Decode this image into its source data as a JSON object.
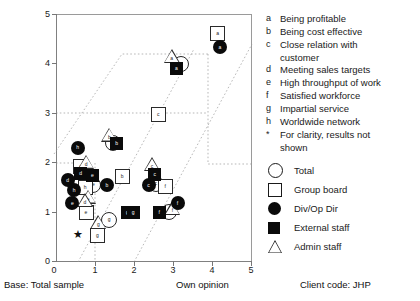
{
  "axes": {
    "y_ticks": [
      "0",
      "1",
      "2",
      "3",
      "4",
      "5"
    ],
    "x_ticks": [
      "0",
      "1",
      "2",
      "3",
      "4",
      "5"
    ],
    "xlabel_right": "Own opinion",
    "base_caption": "Base: Total sample",
    "client_code": "Client code:  JHP"
  },
  "key": {
    "items": [
      {
        "letter": "a",
        "text": "Being profitable"
      },
      {
        "letter": "b",
        "text": "Being cost effective"
      },
      {
        "letter": "c",
        "text": "Close relation with",
        "cont": "customer"
      },
      {
        "letter": "d",
        "text": "Meeting sales targets"
      },
      {
        "letter": "e",
        "text": "High throughput of work"
      },
      {
        "letter": "f",
        "text": "Satisfied workforce"
      },
      {
        "letter": "g",
        "text": "Impartial service"
      },
      {
        "letter": "h",
        "text": "Worldwide network"
      },
      {
        "letter": "*",
        "text": "For clarity, results not",
        "cont": "shown"
      }
    ]
  },
  "legend": {
    "items": [
      {
        "glyph": "circle-outline-icon",
        "label": "Total"
      },
      {
        "glyph": "square-outline-icon",
        "label": "Group board"
      },
      {
        "glyph": "circle-filled-icon",
        "label": "Div/Op Dir"
      },
      {
        "glyph": "square-filled-icon",
        "label": "External staff"
      },
      {
        "glyph": "triangle-outline-icon",
        "label": "Admin staff"
      }
    ]
  },
  "chart_data": {
    "type": "scatter",
    "title": "",
    "xlabel": "Own opinion",
    "ylabel": "",
    "xlim": [
      0,
      5
    ],
    "ylim": [
      0,
      5
    ],
    "grid": false,
    "legend_position": "right",
    "annotations": [
      "Base: Total sample",
      "Own opinion",
      "Client code:  JHP",
      "For clarity, results not shown"
    ],
    "series": [
      {
        "name": "Total",
        "marker": "circle-outline",
        "points": [
          {
            "label": "a",
            "x": 3.16,
            "y": 4.02
          },
          {
            "label": "b",
            "x": 1.44,
            "y": 2.41
          },
          {
            "label": "d",
            "x": 0.66,
            "y": 1.92
          },
          {
            "label": "e",
            "x": 0.93,
            "y": 1.58
          },
          {
            "label": "c",
            "x": 2.52,
            "y": 1.6
          },
          {
            "label": "g",
            "x": 1.33,
            "y": 0.87
          },
          {
            "label": "f",
            "x": 2.86,
            "y": 1.03
          }
        ]
      },
      {
        "name": "Group board",
        "marker": "square-outline",
        "points": [
          {
            "label": "a",
            "x": 4.1,
            "y": 4.62
          },
          {
            "label": "c",
            "x": 2.58,
            "y": 3.0
          },
          {
            "label": "b",
            "x": 1.66,
            "y": 1.75
          },
          {
            "label": "f",
            "x": 2.76,
            "y": 1.55
          },
          {
            "label": "d",
            "x": 0.6,
            "y": 1.95
          },
          {
            "label": "h",
            "x": 0.72,
            "y": 1.52
          },
          {
            "label": "e",
            "x": 0.74,
            "y": 1.02
          },
          {
            "label": "g",
            "x": 1.03,
            "y": 0.56
          }
        ]
      },
      {
        "name": "Div/Op Dir",
        "marker": "circle-filled",
        "points": [
          {
            "label": "a",
            "x": 4.18,
            "y": 4.33
          },
          {
            "label": "h",
            "x": 0.55,
            "y": 2.3
          },
          {
            "label": "b",
            "x": 1.3,
            "y": 1.55
          },
          {
            "label": "c",
            "x": 2.36,
            "y": 1.55
          },
          {
            "label": "d",
            "x": 0.3,
            "y": 1.65
          },
          {
            "label": "h",
            "x": 0.46,
            "y": 1.45
          },
          {
            "label": "e",
            "x": 0.42,
            "y": 1.18
          },
          {
            "label": "f",
            "x": 3.1,
            "y": 1.18
          }
        ]
      },
      {
        "name": "External staff",
        "marker": "square-filled",
        "points": [
          {
            "label": "a",
            "x": 3.07,
            "y": 3.9
          },
          {
            "label": "b",
            "x": 1.55,
            "y": 2.38
          },
          {
            "label": "c",
            "x": 2.52,
            "y": 1.77
          },
          {
            "label": "d",
            "x": 0.63,
            "y": 1.78
          },
          {
            "label": "e",
            "x": 0.93,
            "y": 1.75
          },
          {
            "label": "g",
            "x": 1.82,
            "y": 1.0
          },
          {
            "label": "g",
            "x": 1.97,
            "y": 1.0
          },
          {
            "label": "f",
            "x": 2.63,
            "y": 1.0
          }
        ]
      },
      {
        "name": "Admin staff",
        "marker": "triangle-outline",
        "points": [
          {
            "label": "a",
            "x": 2.95,
            "y": 4.13
          },
          {
            "label": "b",
            "x": 1.36,
            "y": 2.55
          },
          {
            "label": "c",
            "x": 2.45,
            "y": 1.95
          },
          {
            "label": "d",
            "x": 0.77,
            "y": 2.0
          },
          {
            "label": "e",
            "x": 0.82,
            "y": 1.3
          },
          {
            "label": "d",
            "x": 0.74,
            "y": 1.22
          },
          {
            "label": "g",
            "x": 1.08,
            "y": 0.78
          },
          {
            "label": "f",
            "x": 2.97,
            "y": 1.06
          }
        ]
      },
      {
        "name": "Not shown",
        "marker": "star",
        "points": [
          {
            "label": "*",
            "x": 0.53,
            "y": 0.55
          }
        ]
      }
    ]
  }
}
